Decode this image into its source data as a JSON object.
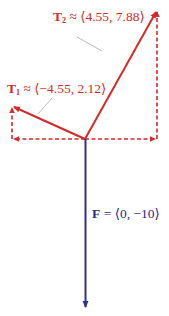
{
  "diagram": {
    "type": "force-vector-diagram",
    "colors": {
      "tension": "#d42a2a",
      "force": "#2e2e8e",
      "leader": "#bbbbbb"
    },
    "vectors": [
      {
        "id": "T2",
        "symbol": "T",
        "subscript": "2",
        "relation": "≈",
        "components": "⟨4.55, 7.88⟩",
        "x": 4.55,
        "y": 7.88
      },
      {
        "id": "T1",
        "symbol": "T",
        "subscript": "1",
        "relation": "≈",
        "components": "⟨−4.55, 2.12⟩",
        "x": -4.55,
        "y": 2.12
      },
      {
        "id": "F",
        "symbol": "F",
        "subscript": "",
        "relation": "=",
        "components": "⟨0, −10⟩",
        "x": 0,
        "y": -10
      }
    ]
  }
}
